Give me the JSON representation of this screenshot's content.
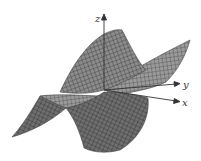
{
  "figure": {
    "type": "3d-surface-plot",
    "axes": {
      "x_label": "x",
      "y_label": "y",
      "z_label": "z"
    },
    "colors": {
      "surface_fill": "#8a8a8a",
      "surface_dark": "#5e5e5e",
      "mesh_line": "#3a3a3a",
      "axis": "#333333",
      "background": "#ffffff"
    }
  }
}
